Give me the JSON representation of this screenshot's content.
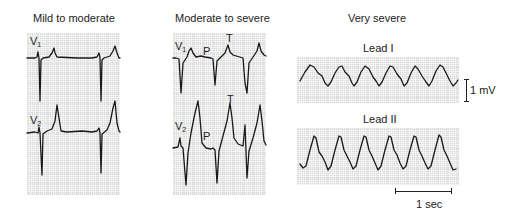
{
  "panels": {
    "mild": {
      "title": "Mild to moderate",
      "leads": [
        {
          "label": "V",
          "sub": "1"
        },
        {
          "label": "V",
          "sub": "2"
        }
      ]
    },
    "moderate": {
      "title": "Moderate to severe",
      "leads": [
        {
          "label": "V",
          "sub": "1"
        },
        {
          "label": "V",
          "sub": "2"
        }
      ],
      "wave_labels": {
        "p": "P",
        "t": "T"
      }
    },
    "very_severe": {
      "title": "Very severe",
      "strips": [
        {
          "label": "Lead I"
        },
        {
          "label": "Lead II"
        }
      ],
      "voltage_scale": "1 mV",
      "time_scale": "1 sec"
    }
  },
  "colors": {
    "grid_bg": "#dcdcdc",
    "trace": "#1a1a1a",
    "text": "#222222"
  }
}
